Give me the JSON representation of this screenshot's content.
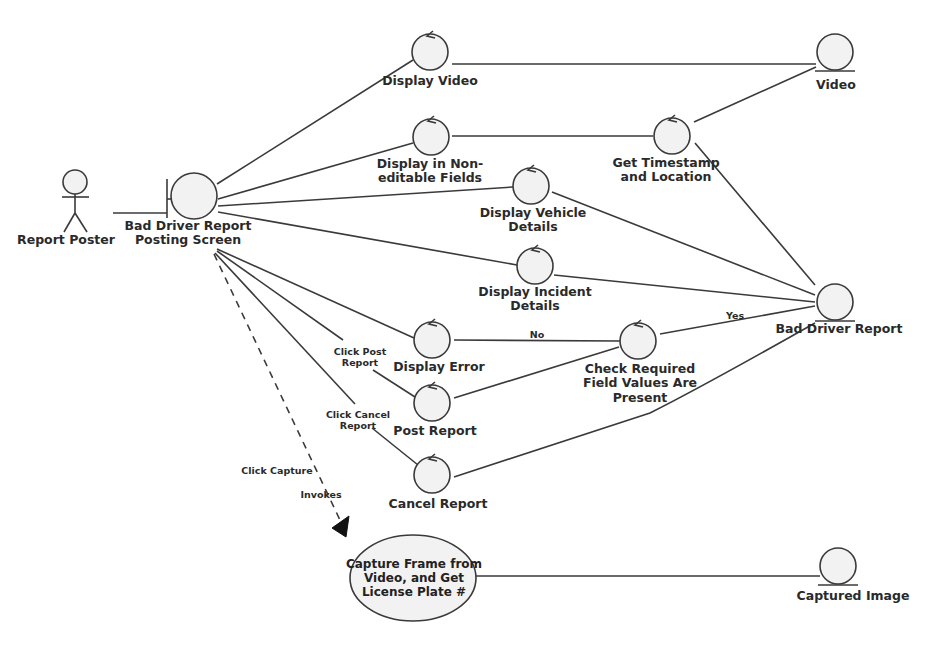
{
  "diagram": {
    "type": "robustness-diagram",
    "actor": {
      "label": "Report Poster"
    },
    "boundary": {
      "label": "Bad Driver Report Posting Screen",
      "line1": "Bad Driver Report",
      "line2": "Posting Screen"
    },
    "controls": [
      {
        "id": "display_video",
        "line1": "Display Video",
        "line2": ""
      },
      {
        "id": "display_non_editable",
        "line1": "Display in Non-",
        "line2": "editable Fields"
      },
      {
        "id": "get_timestamp",
        "line1": "Get Timestamp",
        "line2": "and Location"
      },
      {
        "id": "display_vehicle",
        "line1": "Display Vehicle",
        "line2": "Details"
      },
      {
        "id": "display_incident",
        "line1": "Display Incident",
        "line2": "Details"
      },
      {
        "id": "display_error",
        "line1": "Display Error",
        "line2": ""
      },
      {
        "id": "check_required",
        "line1": "Check Required",
        "line2": "Field Values Are",
        "line3": "Present"
      },
      {
        "id": "post_report",
        "line1": "Post Report",
        "line2": ""
      },
      {
        "id": "cancel_report",
        "line1": "Cancel Report",
        "line2": ""
      }
    ],
    "entities": [
      {
        "id": "video",
        "label": "Video"
      },
      {
        "id": "bad_driver_report",
        "label": "Bad Driver Report"
      },
      {
        "id": "captured_image",
        "label": "Captured Image"
      }
    ],
    "use_case": {
      "line1": "Capture Frame from",
      "line2": "Video, and Get",
      "line3": "License Plate #"
    },
    "edge_labels": {
      "click_post_1": "Click Post",
      "click_post_2": "Report",
      "click_cancel_1": "Click Cancel",
      "click_cancel_2": "Report",
      "click_capture": "Click Capture",
      "invokes": "Invokes",
      "no": "No",
      "yes": "Yes"
    }
  }
}
